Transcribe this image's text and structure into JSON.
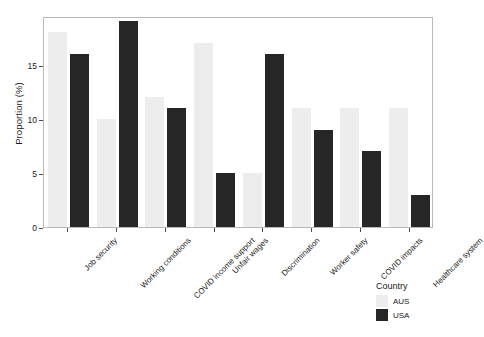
{
  "chart_data": {
    "type": "bar",
    "title": "",
    "subtitle": "",
    "xlabel": "",
    "ylabel": "Proportion (%)",
    "categories": [
      "Job security",
      "Working conditions",
      "COVID income support",
      "Unfair wages",
      "Discrimination",
      "Worker safety",
      "COVID impacts",
      "Healthcare system"
    ],
    "series": [
      {
        "name": "AUS",
        "color": "#ededed",
        "values": [
          18,
          10,
          12,
          17,
          5,
          11,
          11,
          11
        ]
      },
      {
        "name": "USA",
        "color": "#262626",
        "values": [
          16,
          19,
          11,
          5,
          16,
          9,
          7,
          3
        ]
      }
    ],
    "ylim": [
      0,
      19.5
    ],
    "yticks": [
      0,
      5,
      10,
      15
    ],
    "ytick_labels": [
      "0",
      "5",
      "10",
      "15"
    ],
    "grid": false,
    "legend_position": "right-bottom",
    "legend_title": "Country"
  },
  "legend": {
    "title": "Country",
    "entries": [
      {
        "label": "AUS",
        "color": "#ededed"
      },
      {
        "label": "USA",
        "color": "#262626"
      }
    ]
  },
  "axes": {
    "y_title": "Proportion (%)"
  }
}
